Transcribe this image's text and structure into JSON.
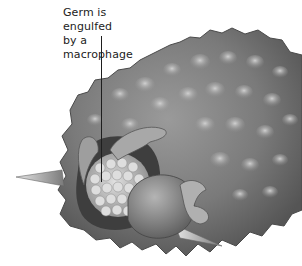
{
  "figure": {
    "labels": [
      {
        "text_line1": "Germ is engulfed",
        "text_line2": "by a macrophage"
      }
    ],
    "illustration": {
      "subject": "macrophage engulfing germ",
      "palette": {
        "background": "#ffffff",
        "cell_body_dark": "#5e5e5e",
        "cell_body_mid": "#8a8a8a",
        "cell_highlight": "#c9c9c9",
        "germ_light": "#d8d8d8",
        "leader_line": "#1e1e1e"
      }
    }
  }
}
